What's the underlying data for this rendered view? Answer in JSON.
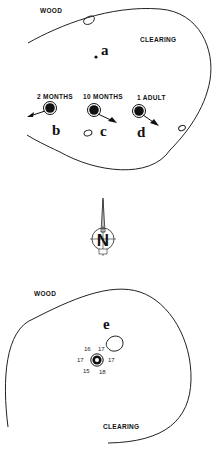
{
  "top_map": {
    "labels": {
      "wood": "WOOD",
      "clearing": "CLEARING"
    },
    "sites": [
      {
        "id": "a",
        "letter": "a",
        "caption": ""
      },
      {
        "id": "b",
        "letter": "b",
        "caption": "2 MONTHS"
      },
      {
        "id": "c",
        "letter": "c",
        "caption": "10 MONTHS"
      },
      {
        "id": "d",
        "letter": "d",
        "caption": "1 ADULT"
      }
    ]
  },
  "compass": {
    "label": "N",
    "icon": "north-arrow-icon"
  },
  "bottom_map": {
    "labels": {
      "wood": "WOOD",
      "clearing": "CLEARING"
    },
    "site": {
      "letter": "e"
    },
    "readings": {
      "top_left": "16",
      "top_right": "17",
      "left": "17",
      "right": "17",
      "bottom_left": "15",
      "bottom_right": "18"
    }
  }
}
